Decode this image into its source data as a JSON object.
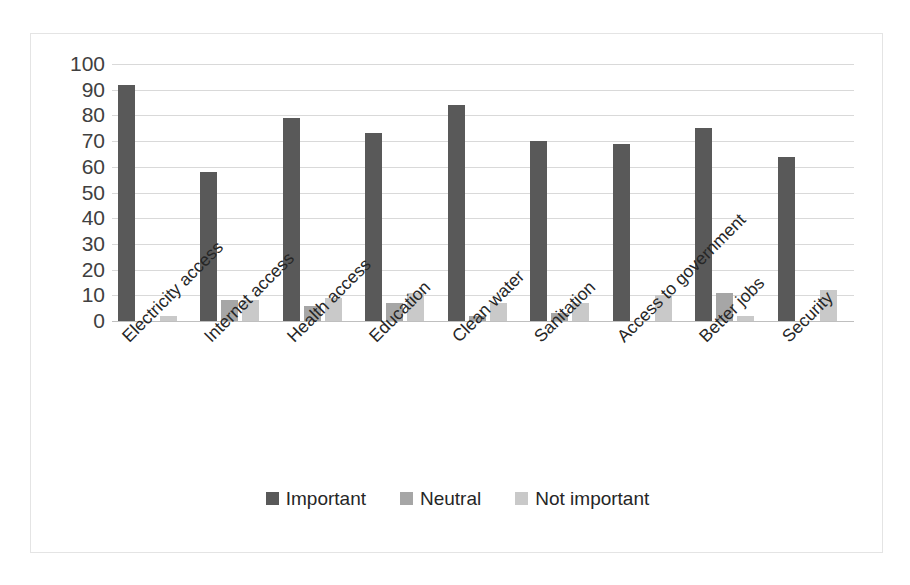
{
  "chart_data": {
    "type": "bar",
    "title": "",
    "subtitle": "",
    "xlabel": "",
    "ylabel": "",
    "ylim": [
      0,
      100
    ],
    "ytick_step": 10,
    "yticks": [
      "100",
      "90",
      "80",
      "70",
      "60",
      "50",
      "40",
      "30",
      "20",
      "10",
      "0"
    ],
    "grid": true,
    "legend_position": "bottom-center",
    "categories": [
      "Electricity access",
      "Internet access",
      "Health access",
      "Education",
      "Clean water",
      "Sanitation",
      "Access to government",
      "Better jobs",
      "Security"
    ],
    "series": [
      {
        "name": "Important",
        "color": "#595959",
        "values": [
          92,
          58,
          79,
          73,
          84,
          70,
          69,
          75,
          64
        ]
      },
      {
        "name": "Neutral",
        "color": "#a6a6a6",
        "values": [
          0,
          8,
          6,
          7,
          2,
          3,
          0,
          11,
          0
        ]
      },
      {
        "name": "Not important",
        "color": "#c9c9c9",
        "values": [
          2,
          8,
          9,
          11,
          7,
          7,
          10,
          2,
          12
        ]
      }
    ]
  },
  "legend": {
    "items": [
      {
        "label": "Important",
        "color": "#595959"
      },
      {
        "label": "Neutral",
        "color": "#a6a6a6"
      },
      {
        "label": "Not important",
        "color": "#c9c9c9"
      }
    ]
  },
  "colors": {
    "important": "#595959",
    "neutral": "#a6a6a6",
    "not_important": "#c9c9c9",
    "gridline": "#d9d9d9",
    "border": "#e4e4e4",
    "text": "#262626",
    "background": "#ffffff"
  }
}
